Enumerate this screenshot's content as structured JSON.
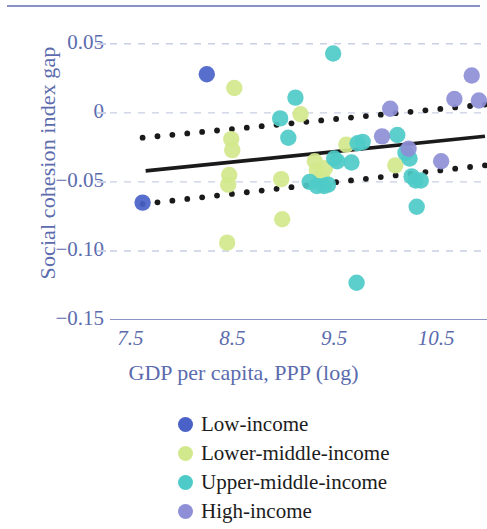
{
  "chart_data": {
    "type": "scatter",
    "title": "",
    "xlabel": "GDP per capita, PPP (log)",
    "ylabel": "Social cohesion index gap",
    "xlim": [
      7.3,
      11.0
    ],
    "ylim": [
      -0.15,
      0.06
    ],
    "xticks": [
      "7.5",
      "8.5",
      "9.5",
      "10.5"
    ],
    "xtick_values": [
      7.5,
      8.5,
      9.5,
      10.5
    ],
    "yticks": [
      "0.05",
      "0",
      "−0.05",
      "−0.10",
      "−0.15"
    ],
    "ytick_values": [
      0.05,
      0,
      -0.05,
      -0.1,
      -0.15
    ],
    "grid": "horizontal-dashed",
    "legend_position": "below",
    "axis_color": "#8a93c4",
    "label_color": "#5b6bad",
    "series": [
      {
        "name": "Low-income",
        "color": "#4a62c8",
        "points": [
          [
            8.25,
            0.028
          ],
          [
            7.62,
            -0.065
          ]
        ]
      },
      {
        "name": "Lower-middle-income",
        "color": "#d2e88c",
        "points": [
          [
            8.52,
            0.018
          ],
          [
            8.49,
            -0.019
          ],
          [
            8.5,
            -0.027
          ],
          [
            8.47,
            -0.045
          ],
          [
            8.46,
            -0.052
          ],
          [
            8.45,
            -0.094
          ],
          [
            8.98,
            -0.048
          ],
          [
            8.99,
            -0.077
          ],
          [
            9.17,
            -0.001
          ],
          [
            9.31,
            -0.035
          ],
          [
            9.33,
            -0.042
          ],
          [
            9.38,
            -0.046
          ],
          [
            9.41,
            -0.04
          ],
          [
            9.62,
            -0.023
          ],
          [
            10.1,
            -0.038
          ]
        ]
      },
      {
        "name": "Upper-middle-income",
        "color": "#4ecbc8",
        "points": [
          [
            9.49,
            0.043
          ],
          [
            9.12,
            0.011
          ],
          [
            8.97,
            -0.004
          ],
          [
            9.05,
            -0.018
          ],
          [
            9.5,
            -0.033
          ],
          [
            9.53,
            -0.035
          ],
          [
            9.26,
            -0.05
          ],
          [
            9.33,
            -0.053
          ],
          [
            9.4,
            -0.053
          ],
          [
            9.44,
            -0.052
          ],
          [
            9.67,
            -0.036
          ],
          [
            9.73,
            -0.022
          ],
          [
            9.78,
            -0.021
          ],
          [
            10.12,
            -0.016
          ],
          [
            10.2,
            -0.029
          ],
          [
            10.24,
            -0.033
          ],
          [
            10.26,
            -0.046
          ],
          [
            10.3,
            -0.049
          ],
          [
            10.35,
            -0.049
          ],
          [
            10.31,
            -0.068
          ],
          [
            9.72,
            -0.123
          ]
        ]
      },
      {
        "name": "High-income",
        "color": "#8e8fd6",
        "points": [
          [
            10.05,
            0.003
          ],
          [
            10.68,
            0.01
          ],
          [
            10.85,
            0.027
          ],
          [
            10.92,
            0.009
          ],
          [
            10.23,
            -0.026
          ],
          [
            10.55,
            -0.035
          ],
          [
            9.97,
            -0.017
          ]
        ]
      }
    ],
    "fit_line": {
      "name": "linear fit",
      "style": "solid",
      "color": "#1a1a1a",
      "x": [
        7.65,
        10.98
      ],
      "y": [
        -0.042,
        -0.017
      ]
    },
    "confidence_bands": [
      {
        "name": "upper confidence band",
        "style": "dotted",
        "color": "#1a1a1a",
        "x": [
          7.62,
          10.98
        ],
        "y": [
          -0.018,
          0.006
        ]
      },
      {
        "name": "lower confidence band",
        "style": "dotted",
        "color": "#1a1a1a",
        "x": [
          7.62,
          10.98
        ],
        "y": [
          -0.066,
          -0.038
        ]
      }
    ]
  },
  "axes": {
    "ylabel": "Social cohesion index gap",
    "xlabel": "GDP per capita, PPP (log)",
    "yticks": [
      {
        "label": "0.05"
      },
      {
        "label": "0"
      },
      {
        "label": "−0.05"
      },
      {
        "label": "−0.10"
      },
      {
        "label": "−0.15"
      }
    ],
    "xticks": [
      {
        "label": "7.5"
      },
      {
        "label": "8.5"
      },
      {
        "label": "9.5"
      },
      {
        "label": "10.5"
      }
    ]
  },
  "legend": {
    "items": [
      {
        "label": "Low-income",
        "color": "#4a62c8"
      },
      {
        "label": "Lower-middle-income",
        "color": "#d2e88c"
      },
      {
        "label": "Upper-middle-income",
        "color": "#4ecbc8"
      },
      {
        "label": "High-income",
        "color": "#8e8fd6"
      }
    ]
  }
}
